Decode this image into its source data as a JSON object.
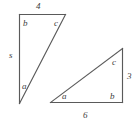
{
  "figure": {
    "stroke_color": "#5a5a5a",
    "label_color": "#3d3d3d",
    "background_color": "#ffffff"
  },
  "triangle_left": {
    "name": "tall narrow triangle",
    "angle_top_left": "b",
    "angle_top_right": "c",
    "angle_bottom": "a",
    "side_left": "s",
    "side_top": "4"
  },
  "triangle_right": {
    "name": "wide right triangle",
    "angle_top": "c",
    "angle_bottom_right": "b",
    "angle_bottom_left": "a",
    "side_right": "3",
    "side_bottom": "6"
  }
}
